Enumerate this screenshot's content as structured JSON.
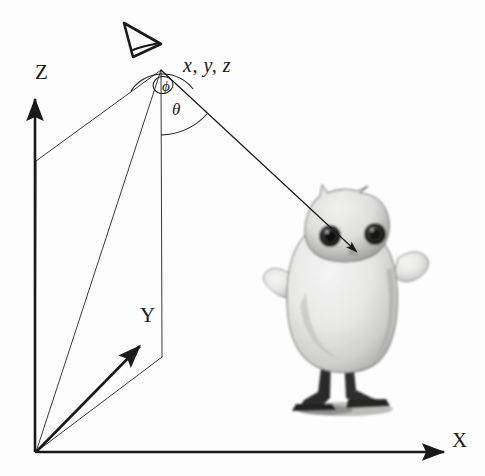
{
  "figure": {
    "background_color": "#fdfdfd",
    "line_color": "#1a1a1a",
    "thin_line_color": "#3a3a3a"
  },
  "axes": {
    "z": {
      "label": "Z",
      "name": "z-axis"
    },
    "y": {
      "label": "Y",
      "name": "y-axis"
    },
    "x": {
      "label": "X",
      "name": "x-axis"
    }
  },
  "labels": {
    "viewpoint_coords": "x, y, z",
    "azimuth_angle": "ϕ",
    "polar_angle": "θ"
  },
  "icons": {
    "eye": "eye-icon",
    "arrow_to_target": "line-of-sight-arrow-icon"
  },
  "object": {
    "name": "owl-figurine",
    "caption": ""
  },
  "geometry": {
    "origin": [
      35,
      453
    ],
    "viewpoint": [
      161,
      70
    ],
    "z_axis_tip": [
      35,
      95
    ],
    "x_axis_tip": [
      448,
      452
    ],
    "y_axis_tip": [
      143,
      342
    ],
    "target_point": [
      357,
      252
    ],
    "drop_line_bottom": [
      162,
      357
    ]
  }
}
